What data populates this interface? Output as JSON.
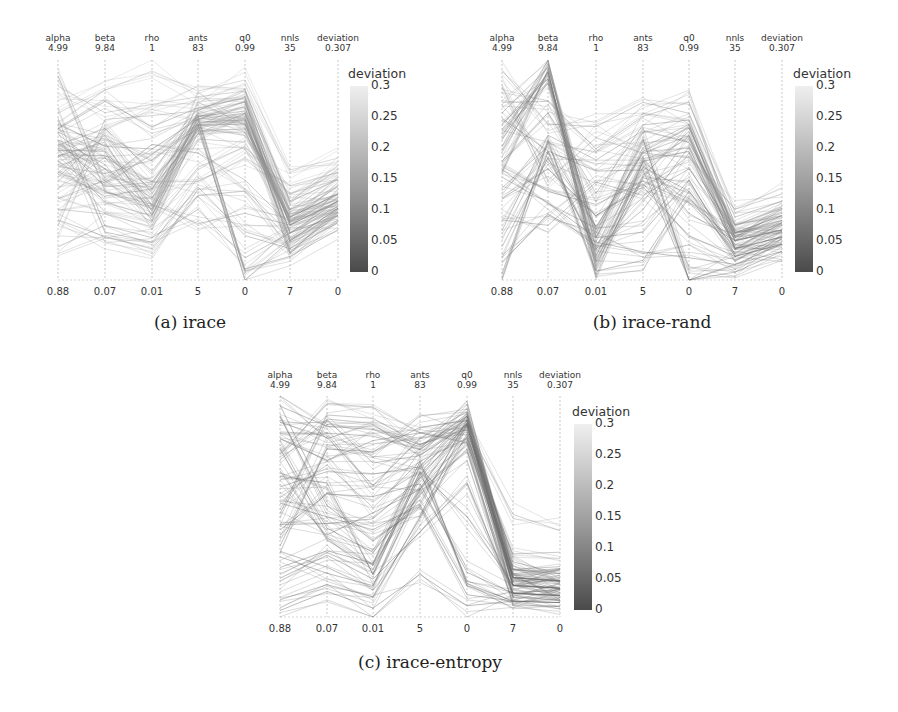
{
  "chart_data": [
    {
      "type": "parallel_coordinates",
      "id": "a",
      "caption": "(a) irace",
      "axes": [
        {
          "name": "alpha",
          "max": "4.99",
          "min": "0.88",
          "ticks": [
            "1",
            "1.5",
            "2",
            "2.5",
            "3",
            "3.5",
            "4",
            "4.5"
          ]
        },
        {
          "name": "beta",
          "max": "9.84",
          "min": "0.07",
          "ticks": [
            "2",
            "4",
            "6",
            "8"
          ]
        },
        {
          "name": "rho",
          "max": "1",
          "min": "0.01",
          "ticks": [
            "0.2",
            "0.4",
            "0.6",
            "0.8",
            "1"
          ]
        },
        {
          "name": "ants",
          "max": "83",
          "min": "5",
          "ticks": [
            "10",
            "20",
            "30",
            "40",
            "50",
            "60",
            "70",
            "80"
          ]
        },
        {
          "name": "q0",
          "max": "0.99",
          "min": "0",
          "ticks": [
            "0",
            "0.2",
            "0.4",
            "0.6",
            "0.8"
          ]
        },
        {
          "name": "nnls",
          "max": "35",
          "min": "7",
          "ticks": [
            "10",
            "15",
            "20",
            "25",
            "30",
            "35"
          ]
        },
        {
          "name": "deviation",
          "max": "0.307",
          "min": "0",
          "ticks": [
            "0",
            "0.05",
            "0.1",
            "0.15",
            "0.2",
            "0.25",
            "0.3"
          ]
        }
      ],
      "colorbar": {
        "title": "deviation",
        "ticks": [
          "0",
          "0.05",
          "0.1",
          "0.15",
          "0.2",
          "0.25",
          "0.3"
        ],
        "range": [
          0,
          0.3
        ],
        "colormap": "grayscale (dark=low, light=high)"
      },
      "lines_summary": "Dense cluster: alpha ~3-3.5, beta ~4-6, rho ~0.3-0.5, ants ~55-65, q0 ~0.6-0.8, nnls ~12-18, deviation ~0.08-0.15",
      "lines": [
        [
          3.3,
          5.8,
          0.35,
          62,
          0.75,
          14,
          0.11
        ],
        [
          3.5,
          4.2,
          0.45,
          60,
          0.7,
          15,
          0.12
        ],
        [
          3.2,
          6.2,
          0.3,
          63,
          0.78,
          13,
          0.1
        ],
        [
          2.9,
          3.8,
          0.42,
          58,
          0.68,
          16,
          0.13
        ],
        [
          3.6,
          5.0,
          0.38,
          61,
          0.72,
          12,
          0.09
        ],
        [
          3.4,
          6.8,
          0.5,
          64,
          0.8,
          14,
          0.11
        ],
        [
          2.2,
          3.0,
          0.25,
          45,
          0.6,
          18,
          0.14
        ],
        [
          4.5,
          7.5,
          0.8,
          70,
          0.85,
          17,
          0.16
        ],
        [
          2.0,
          2.0,
          0.15,
          35,
          0.4,
          12,
          0.1
        ],
        [
          3.0,
          4.8,
          0.55,
          59,
          0.65,
          15,
          0.12
        ],
        [
          3.7,
          8.0,
          0.7,
          66,
          0.82,
          11,
          0.08
        ],
        [
          2.6,
          5.5,
          0.45,
          40,
          0.55,
          19,
          0.15
        ],
        [
          1.5,
          2.5,
          0.2,
          30,
          0.1,
          13,
          0.09
        ],
        [
          3.8,
          6.0,
          0.6,
          62,
          0.05,
          10,
          0.07
        ],
        [
          3.1,
          4.0,
          0.35,
          25,
          0.3,
          14,
          0.11
        ],
        [
          4.0,
          8.5,
          0.95,
          72,
          0.9,
          21,
          0.17
        ],
        [
          3.3,
          3.5,
          0.3,
          57,
          0.75,
          16,
          0.12
        ],
        [
          2.8,
          6.5,
          0.4,
          55,
          0.62,
          15,
          0.13
        ],
        [
          3.5,
          5.2,
          0.28,
          60,
          0.0,
          12,
          0.1
        ],
        [
          2.4,
          4.5,
          0.62,
          50,
          0.45,
          14,
          0.12
        ],
        [
          3.9,
          2.2,
          0.18,
          38,
          0.2,
          11,
          0.09
        ],
        [
          1.9,
          7.2,
          0.75,
          65,
          0.85,
          17,
          0.14
        ],
        [
          3.2,
          5.6,
          0.42,
          63,
          0.76,
          13,
          0.11
        ],
        [
          4.7,
          4.0,
          0.33,
          68,
          0.7,
          15,
          0.12
        ]
      ]
    },
    {
      "type": "parallel_coordinates",
      "id": "b",
      "caption": "(b) irace-rand",
      "axes": [
        {
          "name": "alpha",
          "max": "4.99",
          "min": "0.88",
          "ticks": [
            "1",
            "1.5",
            "2",
            "2.5",
            "3",
            "3.5",
            "4",
            "4.5"
          ]
        },
        {
          "name": "beta",
          "max": "9.84",
          "min": "0.07",
          "ticks": [
            "2",
            "4",
            "6",
            "8"
          ]
        },
        {
          "name": "rho",
          "max": "1",
          "min": "0.01",
          "ticks": [
            "0.2",
            "0.4",
            "0.6",
            "0.8",
            "1"
          ]
        },
        {
          "name": "ants",
          "max": "83",
          "min": "5",
          "ticks": [
            "10",
            "20",
            "30",
            "40",
            "50",
            "60",
            "70",
            "80"
          ]
        },
        {
          "name": "q0",
          "max": "0.99",
          "min": "0",
          "ticks": [
            "0",
            "0.2",
            "0.4",
            "0.6",
            "0.8"
          ]
        },
        {
          "name": "nnls",
          "max": "35",
          "min": "7",
          "ticks": [
            "10",
            "15",
            "20",
            "25",
            "30",
            "35"
          ]
        },
        {
          "name": "deviation",
          "max": "0.307",
          "min": "0",
          "ticks": [
            "0",
            "0.05",
            "0.1",
            "0.15",
            "0.2",
            "0.25",
            "0.3"
          ]
        }
      ],
      "colorbar": {
        "title": "deviation",
        "ticks": [
          "0",
          "0.05",
          "0.1",
          "0.15",
          "0.2",
          "0.25",
          "0.3"
        ],
        "range": [
          0,
          0.3
        ],
        "colormap": "grayscale (dark=low, light=high)"
      },
      "lines_summary": "Widely spread: beta peak near 9.5, rho low ~0.05-0.25, ants ~40-55, q0 ~0.4-0.7, nnls ~10-14, deviation ~0.05-0.1",
      "lines": [
        [
          4.0,
          9.5,
          0.2,
          52,
          0.7,
          12,
          0.08
        ],
        [
          3.5,
          9.3,
          0.1,
          45,
          0.4,
          11,
          0.06
        ],
        [
          2.6,
          6.0,
          0.25,
          50,
          0.65,
          13,
          0.09
        ],
        [
          1.0,
          6.2,
          0.05,
          12,
          0.4,
          10,
          0.05
        ],
        [
          4.2,
          8.0,
          0.6,
          63,
          0.8,
          14,
          0.1
        ],
        [
          3.0,
          4.0,
          0.35,
          40,
          0.35,
          12,
          0.07
        ],
        [
          1.5,
          5.5,
          0.15,
          30,
          0.6,
          11,
          0.06
        ],
        [
          3.8,
          9.0,
          0.22,
          55,
          0.0,
          9,
          0.04
        ],
        [
          2.0,
          2.5,
          0.45,
          35,
          0.5,
          13,
          0.08
        ],
        [
          4.8,
          7.0,
          0.7,
          68,
          0.75,
          15,
          0.11
        ],
        [
          2.8,
          3.5,
          0.2,
          22,
          0.45,
          10,
          0.06
        ],
        [
          3.3,
          9.6,
          0.12,
          48,
          0.3,
          12,
          0.07
        ],
        [
          1.8,
          6.5,
          0.55,
          58,
          0.62,
          14,
          0.09
        ],
        [
          3.6,
          8.8,
          0.08,
          42,
          0.67,
          11,
          0.08
        ],
        [
          2.4,
          5.0,
          0.3,
          38,
          0.2,
          10,
          0.05
        ],
        [
          4.5,
          4.5,
          0.65,
          50,
          0.55,
          16,
          0.12
        ],
        [
          1.2,
          3.0,
          0.18,
          15,
          0.1,
          9,
          0.05
        ],
        [
          3.1,
          7.5,
          0.4,
          60,
          0.72,
          13,
          0.09
        ],
        [
          2.9,
          9.4,
          0.03,
          47,
          0.58,
          12,
          0.07
        ],
        [
          3.9,
          5.8,
          0.5,
          44,
          0.0,
          8,
          0.04
        ]
      ]
    },
    {
      "type": "parallel_coordinates",
      "id": "c",
      "caption": "(c) irace-entropy",
      "axes": [
        {
          "name": "alpha",
          "max": "4.99",
          "min": "0.88",
          "ticks": [
            "1",
            "1.5",
            "2",
            "2.5",
            "3",
            "3.5",
            "4",
            "4.5"
          ]
        },
        {
          "name": "beta",
          "max": "9.84",
          "min": "0.07",
          "ticks": [
            "2",
            "4",
            "6",
            "8"
          ]
        },
        {
          "name": "rho",
          "max": "1",
          "min": "0.01",
          "ticks": [
            "0.2",
            "0.4",
            "0.6",
            "0.8",
            "1"
          ]
        },
        {
          "name": "ants",
          "max": "83",
          "min": "5",
          "ticks": [
            "10",
            "20",
            "30",
            "40",
            "50",
            "60",
            "70",
            "80"
          ]
        },
        {
          "name": "q0",
          "max": "0.99",
          "min": "0",
          "ticks": [
            "0",
            "0.2",
            "0.4",
            "0.6",
            "0.8"
          ]
        },
        {
          "name": "nnls",
          "max": "35",
          "min": "7",
          "ticks": [
            "10",
            "15",
            "20",
            "25",
            "30",
            "35"
          ]
        },
        {
          "name": "deviation",
          "max": "0.307",
          "min": "0",
          "ticks": [
            "0",
            "0.05",
            "0.1",
            "0.15",
            "0.2",
            "0.25",
            "0.3"
          ]
        }
      ],
      "colorbar": {
        "title": "deviation",
        "ticks": [
          "0",
          "0.05",
          "0.1",
          "0.15",
          "0.2",
          "0.25",
          "0.3"
        ],
        "range": [
          0,
          0.3
        ],
        "colormap": "grayscale (dark=low, light=high)"
      },
      "lines_summary": "Most lines: ants ~45-70, q0 ~0.75-0.9, nnls ~9-13, deviation ~0.02-0.06; broad spread on alpha, beta, rho",
      "lines": [
        [
          4.8,
          8.5,
          0.85,
          65,
          0.9,
          11,
          0.04
        ],
        [
          3.5,
          6.0,
          0.2,
          55,
          0.85,
          12,
          0.05
        ],
        [
          2.0,
          2.0,
          0.15,
          50,
          0.8,
          10,
          0.03
        ],
        [
          4.5,
          8.0,
          0.6,
          68,
          0.92,
          13,
          0.06
        ],
        [
          3.0,
          4.5,
          0.4,
          45,
          0.88,
          11,
          0.04
        ],
        [
          1.8,
          3.0,
          0.25,
          60,
          0.15,
          9,
          0.02
        ],
        [
          4.2,
          7.0,
          0.8,
          70,
          0.78,
          12,
          0.05
        ],
        [
          2.5,
          5.5,
          0.55,
          52,
          0.2,
          10,
          0.03
        ],
        [
          3.8,
          8.8,
          0.7,
          62,
          0.86,
          14,
          0.06
        ],
        [
          1.2,
          1.5,
          0.1,
          40,
          0.82,
          11,
          0.04
        ],
        [
          3.3,
          6.5,
          0.65,
          58,
          0.9,
          12,
          0.05
        ],
        [
          4.0,
          4.0,
          0.3,
          48,
          0.75,
          10,
          0.03
        ],
        [
          2.8,
          9.0,
          0.9,
          66,
          0.84,
          13,
          0.07
        ],
        [
          3.6,
          3.5,
          0.22,
          56,
          0.45,
          11,
          0.04
        ],
        [
          2.2,
          7.5,
          0.75,
          72,
          0.88,
          12,
          0.05
        ],
        [
          4.6,
          5.0,
          0.35,
          44,
          0.1,
          9,
          0.02
        ],
        [
          3.1,
          6.8,
          0.5,
          60,
          0.8,
          15,
          0.09
        ],
        [
          1.6,
          2.8,
          0.18,
          35,
          0.6,
          10,
          0.03
        ],
        [
          4.3,
          8.2,
          0.82,
          64,
          0.91,
          12,
          0.05
        ],
        [
          2.6,
          4.2,
          0.45,
          54,
          0.87,
          11,
          0.04
        ],
        [
          3.9,
          9.5,
          0.95,
          70,
          0.85,
          20,
          0.12
        ],
        [
          1.0,
          1.2,
          0.05,
          20,
          0.05,
          9,
          0.02
        ]
      ]
    }
  ],
  "figures": {
    "a": {
      "caption": "(a) irace"
    },
    "b": {
      "caption": "(b) irace-rand"
    },
    "c": {
      "caption": "(c) irace-entropy"
    }
  }
}
